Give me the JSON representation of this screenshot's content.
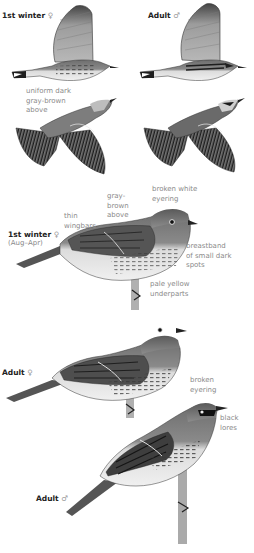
{
  "figures": {
    "flight_1st_winter_female": {
      "label": "1st winter",
      "sex_symbol": "♀"
    },
    "flight_adult_male": {
      "label": "Adult",
      "sex_symbol": "♂"
    },
    "perched_1st_winter_female": {
      "label": "1st winter",
      "sex_symbol": "♀",
      "sublabel": "(Aug–Apr)"
    },
    "perched_adult_female": {
      "label": "Adult",
      "sex_symbol": "♀"
    },
    "perched_adult_male": {
      "label": "Adult",
      "sex_symbol": "♂"
    }
  },
  "annotations": {
    "uniform_dark": "uniform dark\ngray-brown\nabove",
    "thin_wingbars": "thin\nwingbars",
    "gray_brown_above": "gray-\nbrown\nabove",
    "broken_white_eyering": "broken white\neyering",
    "breastband": "breastband\nof small dark\nspots",
    "pale_yellow_underparts": "pale yellow\nunderparts",
    "broken_eyering": "broken\neyering",
    "black_lores": "black\nlores"
  },
  "colors": {
    "ink_dark": "#1e1e1e",
    "body_gray": "#7a7a7a",
    "wing_gray": "#9a9a9a",
    "underpart_light": "#e6e6e6",
    "label_text": "#222222",
    "note_text": "#8a8a8a"
  }
}
